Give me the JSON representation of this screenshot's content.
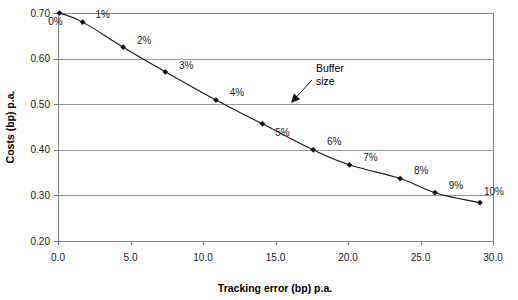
{
  "chart_data": {
    "type": "line",
    "title": "",
    "xlabel": "Tracking error (bp) p.a.",
    "ylabel": "Costs (bp) p.a.",
    "xlim": [
      0.0,
      30.0
    ],
    "ylim": [
      0.2,
      0.7
    ],
    "grid": true,
    "legend": null,
    "x_ticks": [
      "0.0",
      "5.0",
      "10.0",
      "15.0",
      "20.0",
      "25.0",
      "30.0"
    ],
    "x_tick_values": [
      0.0,
      5.0,
      10.0,
      15.0,
      20.0,
      25.0,
      30.0
    ],
    "y_ticks": [
      "0.20",
      "0.30",
      "0.40",
      "0.50",
      "0.60",
      "0.70"
    ],
    "y_tick_values": [
      0.2,
      0.3,
      0.4,
      0.5,
      0.6,
      0.7
    ],
    "series": [
      {
        "name": "Costs vs tracking error",
        "marker": "diamond",
        "points": [
          {
            "label": "0%",
            "x": 0.1,
            "y": 0.7
          },
          {
            "label": "1%",
            "x": 1.7,
            "y": 0.68
          },
          {
            "label": "2%",
            "x": 4.5,
            "y": 0.625
          },
          {
            "label": "3%",
            "x": 7.4,
            "y": 0.571
          },
          {
            "label": "4%",
            "x": 10.9,
            "y": 0.509
          },
          {
            "label": "5%",
            "x": 14.1,
            "y": 0.457
          },
          {
            "label": "6%",
            "x": 17.6,
            "y": 0.4
          },
          {
            "label": "7%",
            "x": 20.1,
            "y": 0.367
          },
          {
            "label": "8%",
            "x": 23.6,
            "y": 0.337
          },
          {
            "label": "9%",
            "x": 26.0,
            "y": 0.306
          },
          {
            "label": "10%",
            "x": 29.1,
            "y": 0.284
          }
        ]
      }
    ],
    "point_label_offsets": [
      {
        "dx": -4,
        "dy": 12
      },
      {
        "dx": 20,
        "dy": -4
      },
      {
        "dx": 21,
        "dy": -3
      },
      {
        "dx": 21,
        "dy": -3
      },
      {
        "dx": 21,
        "dy": -4
      },
      {
        "dx": 20,
        "dy": 12
      },
      {
        "dx": 21,
        "dy": -5
      },
      {
        "dx": 21,
        "dy": -4
      },
      {
        "dx": 21,
        "dy": -5
      },
      {
        "dx": 21,
        "dy": -4
      },
      {
        "dx": 14,
        "dy": -8
      }
    ],
    "annotations": [
      {
        "name": "buffer-size",
        "line1": "Buffer",
        "line2": "size",
        "text_x": 316,
        "text_y": 72,
        "arrow_from_x": 312,
        "arrow_from_y": 80,
        "arrow_to_x": 291,
        "arrow_to_y": 103
      }
    ],
    "colors": {
      "line": "#1b1b1b",
      "marker": "#111111",
      "grid": "#9a9a9a",
      "axis": "#8a8a8a",
      "text": "#1a1a1a",
      "background": "#ffffff"
    }
  },
  "plot_geometry": {
    "left": 58,
    "right": 493,
    "top": 13,
    "bottom": 241
  }
}
